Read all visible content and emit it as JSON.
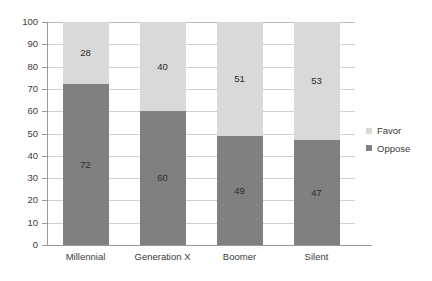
{
  "chart_data": {
    "type": "bar",
    "subtype": "stacked-bar-100",
    "title": "",
    "subtitle": "",
    "xlabel": "",
    "ylabel": "",
    "categories": [
      "Millennial",
      "Generation X",
      "Boomer",
      "Silent"
    ],
    "series": [
      {
        "name": "Favor",
        "values": [
          28,
          40,
          51,
          53
        ],
        "color": "#d9d9d9"
      },
      {
        "name": "Oppose",
        "values": [
          72,
          60,
          49,
          47
        ],
        "color": "#808080"
      }
    ],
    "stack_order_bottom_to_top": [
      "Oppose",
      "Favor"
    ],
    "ylim": [
      0,
      100
    ],
    "ytick_step": 10,
    "yticks": [
      0,
      10,
      20,
      30,
      40,
      50,
      60,
      70,
      80,
      90,
      100
    ],
    "ytick_labels": [
      "0",
      "10",
      "20",
      "30",
      "40",
      "50",
      "60",
      "70",
      "80",
      "90",
      "100"
    ],
    "grid": true,
    "grid_axis": "y",
    "legend": true,
    "legend_position": "right",
    "legend_entries": [
      "Favor",
      "Oppose"
    ],
    "data_labels": true,
    "background_color": "#ffffff",
    "gridline_color": "#d0d0d0",
    "axis_color": "#9a9a9a",
    "text_color": "#3b3b3b"
  }
}
